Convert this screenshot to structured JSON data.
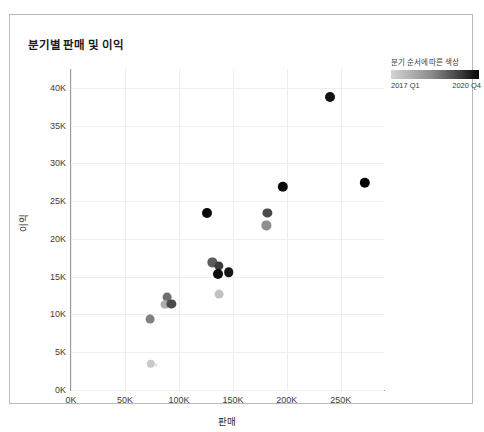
{
  "title": "분기별 판매 및 이익",
  "legend": {
    "title": "분기 순서에 따른 색상",
    "min_label": "2017 Q1",
    "max_label": "2020 Q4",
    "gradient_start": "#d4d4d4",
    "gradient_end": "#050505"
  },
  "chart_data": {
    "type": "scatter",
    "title": "분기별 판매 및 이익",
    "xlabel": "판매",
    "ylabel": "이익",
    "xlim": [
      0,
      290000
    ],
    "ylim": [
      0,
      42500
    ],
    "grid": true,
    "legend_position": "top-right",
    "xticks": [
      "0K",
      "50K",
      "100K",
      "150K",
      "200K",
      "250K"
    ],
    "xtick_values": [
      0,
      50000,
      100000,
      150000,
      200000,
      250000
    ],
    "yticks": [
      "0K",
      "5K",
      "10K",
      "15K",
      "20K",
      "25K",
      "30K",
      "35K",
      "40K"
    ],
    "ytick_values": [
      0,
      5000,
      10000,
      15000,
      20000,
      25000,
      30000,
      35000,
      40000
    ],
    "color_scale": {
      "name": "분기 순서에 따른 색상",
      "min": "2017 Q1",
      "max": "2020 Q4",
      "start_color": "#d4d4d4",
      "end_color": "#050505"
    },
    "points": [
      {
        "label": "2017 Q1",
        "x": 74000,
        "y": 3500,
        "color": "#c9c9c9",
        "r": 4.2
      },
      {
        "label": "2017 Q2",
        "x": 79000,
        "y": 3300,
        "color": "#e0e0e0",
        "r": 1.5
      },
      {
        "label": "2017 Q3",
        "x": 73000,
        "y": 9400,
        "color": "#808080",
        "r": 4.4
      },
      {
        "label": "2017 Q4",
        "x": 89000,
        "y": 12300,
        "color": "#6e6e6e",
        "r": 4.4
      },
      {
        "label": "2018 Q1",
        "x": 87000,
        "y": 11300,
        "color": "#adadad",
        "r": 4.4
      },
      {
        "label": "2018 Q2",
        "x": 93000,
        "y": 11400,
        "color": "#4a4a4a",
        "r": 4.6
      },
      {
        "label": "2018 Q3",
        "x": 137000,
        "y": 12700,
        "color": "#c2c2c2",
        "r": 4.4
      },
      {
        "label": "2018 Q4",
        "x": 131000,
        "y": 16900,
        "color": "#5c5c5c",
        "r": 4.6
      },
      {
        "label": "2019 Q1",
        "x": 137000,
        "y": 16400,
        "color": "#3c3c3c",
        "r": 4.6
      },
      {
        "label": "2019 Q2",
        "x": 136000,
        "y": 15300,
        "color": "#0c0c0c",
        "r": 5.0
      },
      {
        "label": "2019 Q3",
        "x": 146000,
        "y": 15600,
        "color": "#161616",
        "r": 4.8
      },
      {
        "label": "2019 Q4",
        "x": 126000,
        "y": 23500,
        "color": "#0a0a0a",
        "r": 5.0
      },
      {
        "label": "2020 Q1",
        "x": 181000,
        "y": 21800,
        "color": "#8f8f8f",
        "r": 4.6
      },
      {
        "label": "2020 Q2",
        "x": 182000,
        "y": 23500,
        "color": "#4a4a4a",
        "r": 4.6
      },
      {
        "label": "2020 Q3",
        "x": 196000,
        "y": 26900,
        "color": "#0a0a0a",
        "r": 5.2
      },
      {
        "label": "2020 Q4",
        "x": 272000,
        "y": 27400,
        "color": "#050505",
        "r": 5.2
      },
      {
        "label": "2020 Q4b",
        "x": 240000,
        "y": 38800,
        "color": "#121212",
        "r": 5.0
      }
    ]
  }
}
